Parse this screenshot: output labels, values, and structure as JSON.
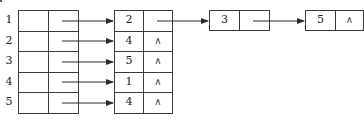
{
  "title_fragment": ":",
  "vertex_table": {
    "rows": [
      {
        "label": "1"
      },
      {
        "label": "2"
      },
      {
        "label": "3"
      },
      {
        "label": "4"
      },
      {
        "label": "5"
      }
    ]
  },
  "edge_lists": [
    {
      "vertex": "1",
      "nodes": [
        {
          "value": "2",
          "next": "→"
        },
        {
          "value": "3",
          "next": "→"
        },
        {
          "value": "5",
          "next": "∧"
        }
      ]
    },
    {
      "vertex": "2",
      "nodes": [
        {
          "value": "4",
          "next": "∧"
        }
      ]
    },
    {
      "vertex": "3",
      "nodes": [
        {
          "value": "5",
          "next": "∧"
        }
      ]
    },
    {
      "vertex": "4",
      "nodes": [
        {
          "value": "1",
          "next": "∧"
        }
      ]
    },
    {
      "vertex": "5",
      "nodes": [
        {
          "value": "4",
          "next": "∧"
        }
      ]
    }
  ],
  "null_symbol": "∧",
  "colors": {
    "line": "#3a3a3a",
    "text": "#222222",
    "background": "#ffffff"
  }
}
